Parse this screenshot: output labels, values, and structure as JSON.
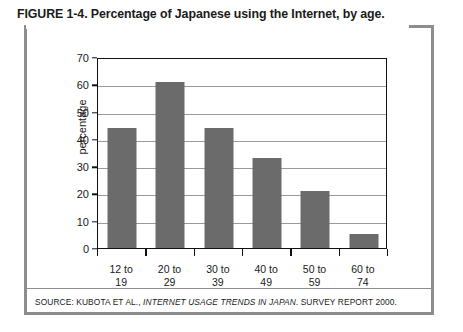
{
  "figure": {
    "title": "FIGURE 1-4. Percentage of Japanese using the Internet, by age.",
    "source_prefix": "SOURCE: KUBOTA ET AL., ",
    "source_italic": "INTERNET USAGE TRENDS IN JAPAN",
    "source_suffix": ". SURVEY REPORT 2000."
  },
  "chart_data": {
    "type": "bar",
    "title": "Percentage of Japanese using the Internet, by age",
    "categories": [
      "12 to 19",
      "20 to 29",
      "30 to 39",
      "40 to 49",
      "50 to 59",
      "60 to 74"
    ],
    "category_lines": [
      [
        "12 to",
        "19"
      ],
      [
        "20 to",
        "29"
      ],
      [
        "30 to",
        "39"
      ],
      [
        "40 to",
        "49"
      ],
      [
        "50 to",
        "59"
      ],
      [
        "60 to",
        "74"
      ]
    ],
    "values": [
      44,
      61,
      44,
      33,
      21,
      5
    ],
    "xlabel": "",
    "ylabel": "percentage",
    "ylim": [
      0,
      70
    ],
    "ytick_labels": [
      "0",
      "10",
      "20",
      "30",
      "40",
      "50",
      "60",
      "70"
    ],
    "ytick_values": [
      0,
      10,
      20,
      30,
      40,
      50,
      60,
      70
    ],
    "grid": true,
    "legend": false,
    "bar_color": "#6b6b6b",
    "axis_color": "#111111",
    "grid_color": "#9a9a9a"
  }
}
